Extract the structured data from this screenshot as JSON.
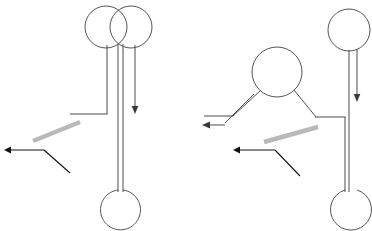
{
  "image": {
    "title": "Line drawing of two stick-like figures with annotation arrows",
    "width": 372,
    "height": 231,
    "background_color": "#ffffff"
  },
  "palette": {
    "outline_stroke": "#4d4d4d",
    "leader_stroke": "#111111",
    "highlight_stroke": "#b9b9b9"
  },
  "figures": [
    {
      "id": "left-figure",
      "name": "double-lollipop-figure",
      "parts": [
        {
          "name": "left-head-circle",
          "cx": 106,
          "cy": 27,
          "r": 21
        },
        {
          "name": "right-head-circle",
          "cx": 131,
          "cy": 27,
          "r": 21
        },
        {
          "name": "left-stem-line",
          "x": 107,
          "y1": 46,
          "y2": 114
        },
        {
          "name": "inner-stem-left-line",
          "x": 118,
          "y1": 46,
          "y2": 192
        },
        {
          "name": "inner-stem-right-line",
          "x": 123,
          "y1": 46,
          "y2": 192
        },
        {
          "name": "right-stem-line",
          "x": 135,
          "y1": 46,
          "y2": 110
        },
        {
          "name": "foot-circle",
          "cx": 120,
          "cy": 209,
          "r": 20
        },
        {
          "name": "shoulder-horizontal-line",
          "y": 114,
          "x1": 70,
          "x2": 107
        }
      ],
      "arrows": [
        {
          "name": "down-arrow",
          "x": 135,
          "y_from": 46,
          "y_to": 112,
          "direction": "down"
        }
      ],
      "annotations": [
        {
          "name": "highlight-stroke",
          "from": [
            33,
            141
          ],
          "to": [
            80,
            122
          ],
          "color": "#b9b9b9"
        },
        {
          "name": "leader-arrow",
          "tail": [
            70,
            173
          ],
          "elbow": [
            44,
            150
          ],
          "tip": [
            5,
            150
          ],
          "direction": "left"
        }
      ]
    },
    {
      "id": "right-figure",
      "name": "person-with-arms-figure",
      "parts": [
        {
          "name": "head-circle",
          "cx": 277,
          "cy": 72,
          "r": 25
        },
        {
          "name": "left-arm-upper-line",
          "from": [
            260,
            89
          ],
          "to": [
            232,
            116
          ]
        },
        {
          "name": "left-arm-lower-line",
          "from": [
            252,
            93
          ],
          "to": [
            224,
            122
          ]
        },
        {
          "name": "left-arm-horizontal-line",
          "y": 116,
          "x1": 204,
          "x2": 232
        },
        {
          "name": "right-arm-line",
          "from": [
            294,
            89
          ],
          "to": [
            315,
            117
          ]
        },
        {
          "name": "right-arm-horizontal-line",
          "y": 117,
          "x1": 315,
          "x2": 345
        },
        {
          "name": "right-leg-vertical-line",
          "x": 345,
          "y1": 117,
          "y2": 192
        },
        {
          "name": "foot-circle",
          "cx": 345,
          "cy": 209,
          "r": 21
        }
      ],
      "arrows": [
        {
          "name": "left-arm-arrow",
          "y": 125,
          "x_from": 224,
          "x_to": 203,
          "direction": "left"
        }
      ],
      "annotations": [
        {
          "name": "highlight-stroke",
          "from": [
            264,
            142
          ],
          "to": [
            318,
            127
          ],
          "color": "#b9b9b9"
        },
        {
          "name": "leader-arrow",
          "tail": [
            300,
            176
          ],
          "elbow": [
            275,
            150
          ],
          "tip": [
            234,
            150
          ],
          "direction": "left"
        }
      ]
    },
    {
      "id": "right-lollipop",
      "name": "single-lollipop-figure",
      "parts": [
        {
          "name": "head-circle",
          "cx": 349,
          "cy": 30,
          "r": 21
        },
        {
          "name": "stem-left-line",
          "x": 349,
          "y1": 50,
          "y2": 192
        },
        {
          "name": "stem-right-line",
          "x": 357,
          "y1": 50,
          "y2": 192
        },
        {
          "name": "foot-circle",
          "cx": 352,
          "cy": 209,
          "r": 21
        }
      ],
      "arrows": [
        {
          "name": "down-arrow",
          "x": 357,
          "y_from": 50,
          "y_to": 100,
          "direction": "down"
        }
      ],
      "annotations": []
    }
  ]
}
